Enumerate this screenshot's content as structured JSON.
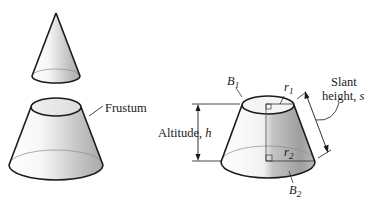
{
  "figure": {
    "left": {
      "label": "Frustum"
    },
    "right": {
      "top_base_label": "B",
      "top_base_sub": "1",
      "top_radius_label": "r",
      "top_radius_sub": "1",
      "bottom_radius_label": "r",
      "bottom_radius_sub": "2",
      "bottom_base_label": "B",
      "bottom_base_sub": "2",
      "altitude_label": "Altitude, ",
      "altitude_var": "h",
      "slant_label_line1": "Slant",
      "slant_label_line2": "height, ",
      "slant_var": "s"
    }
  },
  "colors": {
    "stroke": "#1a1a1a",
    "thin_stroke": "#8a8a8a",
    "shade_dark": "#9a9a9a",
    "shade_light": "#ffffff"
  }
}
